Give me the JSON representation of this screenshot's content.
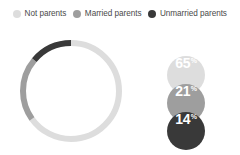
{
  "legend": {
    "items": [
      {
        "label": "Not parents",
        "color": "#dddddd",
        "icon": "legend-dot-icon"
      },
      {
        "label": "Married parents",
        "color": "#9e9e9e",
        "icon": "legend-dot-icon"
      },
      {
        "label": "Unmarried parents",
        "color": "#393939",
        "icon": "legend-dot-icon"
      }
    ]
  },
  "badges": [
    {
      "value": "65",
      "suffix": "%",
      "color": "#dddddd"
    },
    {
      "value": "21",
      "suffix": "%",
      "color": "#9e9e9e"
    },
    {
      "value": "14",
      "suffix": "%",
      "color": "#393939"
    }
  ],
  "chart_data": {
    "type": "pie",
    "variant": "donut",
    "title": "",
    "categories": [
      "Not parents",
      "Married parents",
      "Unmarried parents"
    ],
    "values": [
      65,
      21,
      14
    ],
    "unit": "%",
    "colors": [
      "#dddddd",
      "#9e9e9e",
      "#393939"
    ],
    "start_angle_deg": 0,
    "direction": "clockwise",
    "legend_position": "top",
    "grid": false,
    "geometry": {
      "cx": 55,
      "cy": 59,
      "radius": 48,
      "stroke_width": 6
    },
    "data_labels": [
      "65%",
      "21%",
      "14%"
    ]
  }
}
